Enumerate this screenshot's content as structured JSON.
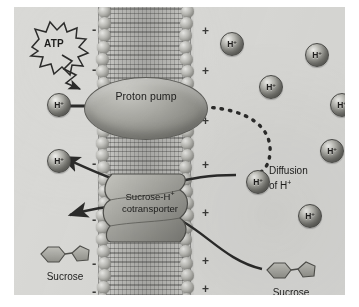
{
  "figure": {
    "panel_bg": "#d9d9d6"
  },
  "labels": {
    "atp": "ATP",
    "proton_pump": "Proton pump",
    "cotransporter_line1": "Sucrose-H",
    "cotransporter_sup": "+",
    "cotransporter_line2": "cotransporter",
    "diffusion_line1": "Diffusion",
    "diffusion_line2_prefix": "of H",
    "diffusion_line2_sup": "+",
    "sucrose_left": "Sucrose",
    "sucrose_right": "Sucrose"
  },
  "ions": {
    "symbol": "H",
    "charge": "+",
    "count": 9,
    "positions": [
      {
        "x": 33,
        "y": 86,
        "side": "cytoplasm",
        "name": "h-ion-pumped-in"
      },
      {
        "x": 33,
        "y": 142,
        "side": "cytoplasm",
        "name": "h-ion-cotransport-in"
      },
      {
        "x": 206,
        "y": 25,
        "side": "apoplast",
        "name": "h-ion-outside-1"
      },
      {
        "x": 291,
        "y": 36,
        "side": "apoplast",
        "name": "h-ion-outside-2"
      },
      {
        "x": 245,
        "y": 68,
        "side": "apoplast",
        "name": "h-ion-outside-3"
      },
      {
        "x": 316,
        "y": 86,
        "side": "apoplast",
        "name": "h-ion-outside-4"
      },
      {
        "x": 306,
        "y": 132,
        "side": "apoplast",
        "name": "h-ion-outside-5"
      },
      {
        "x": 232,
        "y": 163,
        "side": "apoplast",
        "name": "h-ion-diffusing"
      },
      {
        "x": 284,
        "y": 197,
        "side": "apoplast",
        "name": "h-ion-outside-6"
      }
    ]
  },
  "membrane": {
    "inner_charge": "-",
    "outer_charge": "+",
    "minus_positions": [
      {
        "x": 78,
        "y": 16
      },
      {
        "x": 78,
        "y": 56
      },
      {
        "x": 78,
        "y": 104
      },
      {
        "x": 78,
        "y": 150
      },
      {
        "x": 78,
        "y": 206
      },
      {
        "x": 78,
        "y": 250
      },
      {
        "x": 78,
        "y": 278
      }
    ],
    "plus_positions": [
      {
        "x": 188,
        "y": 18
      },
      {
        "x": 188,
        "y": 58
      },
      {
        "x": 188,
        "y": 108
      },
      {
        "x": 188,
        "y": 152
      },
      {
        "x": 188,
        "y": 200
      },
      {
        "x": 188,
        "y": 248
      },
      {
        "x": 188,
        "y": 276
      }
    ]
  },
  "sucrose_molecules": [
    {
      "name": "sucrose-cytoplasm",
      "x": 20,
      "y": 238
    },
    {
      "name": "sucrose-apoplast",
      "x": 246,
      "y": 254
    }
  ],
  "arrows": [
    {
      "name": "atp-energy-arrow",
      "style": "zigzag",
      "from": "ATP",
      "to": "proton-pump"
    },
    {
      "name": "pump-export-arrow",
      "style": "solid",
      "from": "cytoplasm-H+",
      "to": "apoplast"
    },
    {
      "name": "h-diffusion-arrow",
      "style": "dashed-curve",
      "from": "pump-exit",
      "to": "diffusing-H+"
    },
    {
      "name": "h-import-arrow",
      "style": "solid-curve",
      "from": "apoplast-H+",
      "to": "cytoplasm-H+"
    },
    {
      "name": "sucrose-import-arrow",
      "style": "solid-curve",
      "from": "apoplast-sucrose",
      "to": "cytoplasm-sucrose"
    }
  ],
  "colors": {
    "background": "#d9d9d6",
    "protein": "#9a9a94",
    "ion": "#8d8d87",
    "sucrose": "#a8a8a2",
    "stroke": "#2b2b2a",
    "text": "#1d1d1c"
  }
}
